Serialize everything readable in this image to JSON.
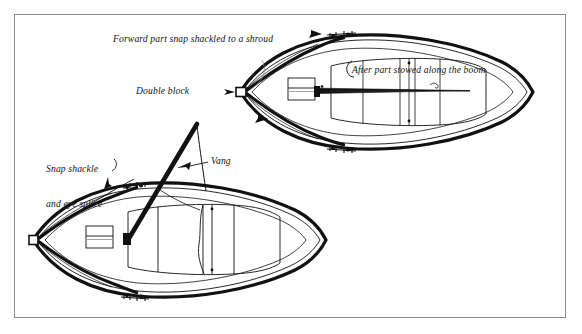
{
  "figure": {
    "type": "line-diagram",
    "background_color": "#ffffff",
    "ink_color": "#111111",
    "frame_color": "#8d8d8d"
  },
  "labels": {
    "forward_part": "Forward part snap shackled to a shroud",
    "double_block": "Double block",
    "after_part": "After part stowed along the boom",
    "snap_shackle_line1": "Snap shackle",
    "snap_shackle_line2": "and eye splice",
    "vang": "Vang"
  },
  "callouts": [
    {
      "name": "forward-part-callout",
      "text": "Forward part snap shackled to a shroud",
      "pointer": "arrow-right"
    },
    {
      "name": "double-block-callout",
      "text": "Double block",
      "pointer": "arrow-right"
    },
    {
      "name": "after-part-callout",
      "text": "After part stowed along the boom",
      "pointer": "hook-left"
    },
    {
      "name": "snap-shackle-callout",
      "text": "Snap shackle and eye splice",
      "pointer": "arrow-down-right"
    },
    {
      "name": "vang-callout",
      "text": "Vang",
      "pointer": "arrow-left"
    }
  ],
  "boats": [
    {
      "name": "upper-boat",
      "caption": "Vang rigged: forward part shackled to shroud, after part stowed on boom",
      "view": "plan",
      "features": [
        "bow-double-block",
        "forward-hatch",
        "cockpit-coaming",
        "boom",
        "gunwale-fittings"
      ]
    },
    {
      "name": "lower-boat",
      "caption": "Vang deployed from bow block up to boom",
      "view": "plan",
      "features": [
        "bow-double-block",
        "forward-hatch",
        "cockpit-coaming",
        "vang-line",
        "gunwale-fittings"
      ]
    }
  ]
}
